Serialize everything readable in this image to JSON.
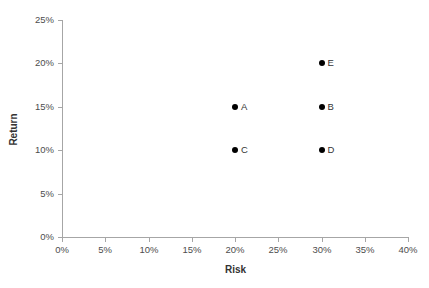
{
  "chart_data": {
    "type": "scatter",
    "title": "",
    "xlabel": "Risk",
    "ylabel": "Return",
    "xlim": [
      0,
      40
    ],
    "ylim": [
      0,
      25
    ],
    "xticks": [
      0,
      5,
      10,
      15,
      20,
      25,
      30,
      35,
      40
    ],
    "yticks": [
      0,
      5,
      10,
      15,
      20,
      25
    ],
    "xtick_labels": [
      "0%",
      "5%",
      "10%",
      "15%",
      "20%",
      "25%",
      "30%",
      "35%",
      "40%"
    ],
    "ytick_labels": [
      "0%",
      "5%",
      "10%",
      "15%",
      "20%",
      "25%"
    ],
    "grid": false,
    "legend": false,
    "marker_color": "#000000",
    "axis_color": "#a6a6a6",
    "points": [
      {
        "label": "A",
        "x": 20,
        "y": 15,
        "x_display": "20%",
        "y_display": "15%"
      },
      {
        "label": "B",
        "x": 30,
        "y": 15,
        "x_display": "30%",
        "y_display": "15%"
      },
      {
        "label": "C",
        "x": 20,
        "y": 10,
        "x_display": "20%",
        "y_display": "10%"
      },
      {
        "label": "D",
        "x": 30,
        "y": 10,
        "x_display": "30%",
        "y_display": "10%"
      },
      {
        "label": "E",
        "x": 30,
        "y": 20,
        "x_display": "30%",
        "y_display": "20%"
      }
    ]
  }
}
